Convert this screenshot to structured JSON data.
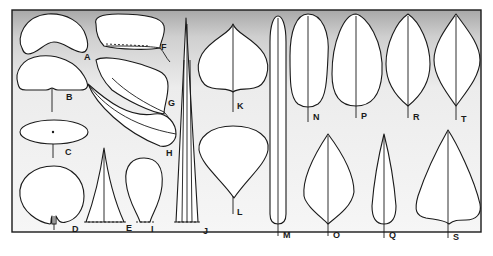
{
  "figure": {
    "background": "stippled gradient, dense at top fading downward",
    "stroke_color": "#1a1a1a",
    "labels": {
      "A": "A",
      "B": "B",
      "C": "C",
      "D": "D",
      "E": "E",
      "F": "F",
      "G": "G",
      "H": "H",
      "I": "I",
      "J": "J",
      "K": "K",
      "L": "L",
      "M": "M",
      "N": "N",
      "O": "O",
      "P": "P",
      "Q": "Q",
      "R": "R",
      "S": "S",
      "T": "T"
    }
  }
}
